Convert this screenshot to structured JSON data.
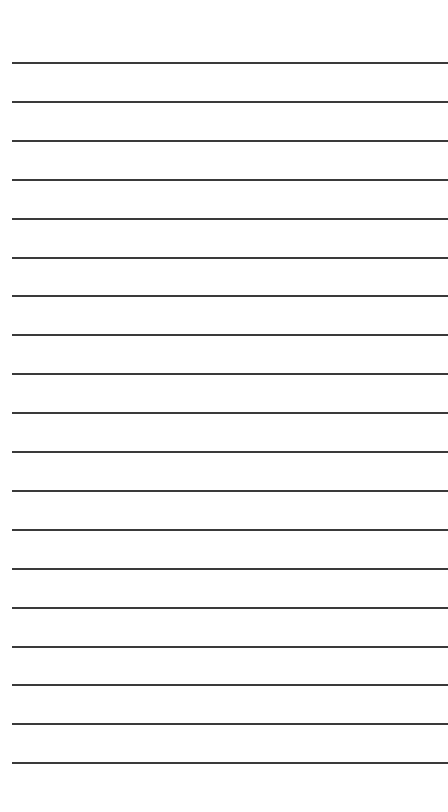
{
  "page": {
    "type": "lined-paper",
    "line_count": 19,
    "first_line_y": 62,
    "line_spacing": 38.9,
    "line_left": 12,
    "line_color": "#3a3a3a",
    "background": "#ffffff"
  }
}
